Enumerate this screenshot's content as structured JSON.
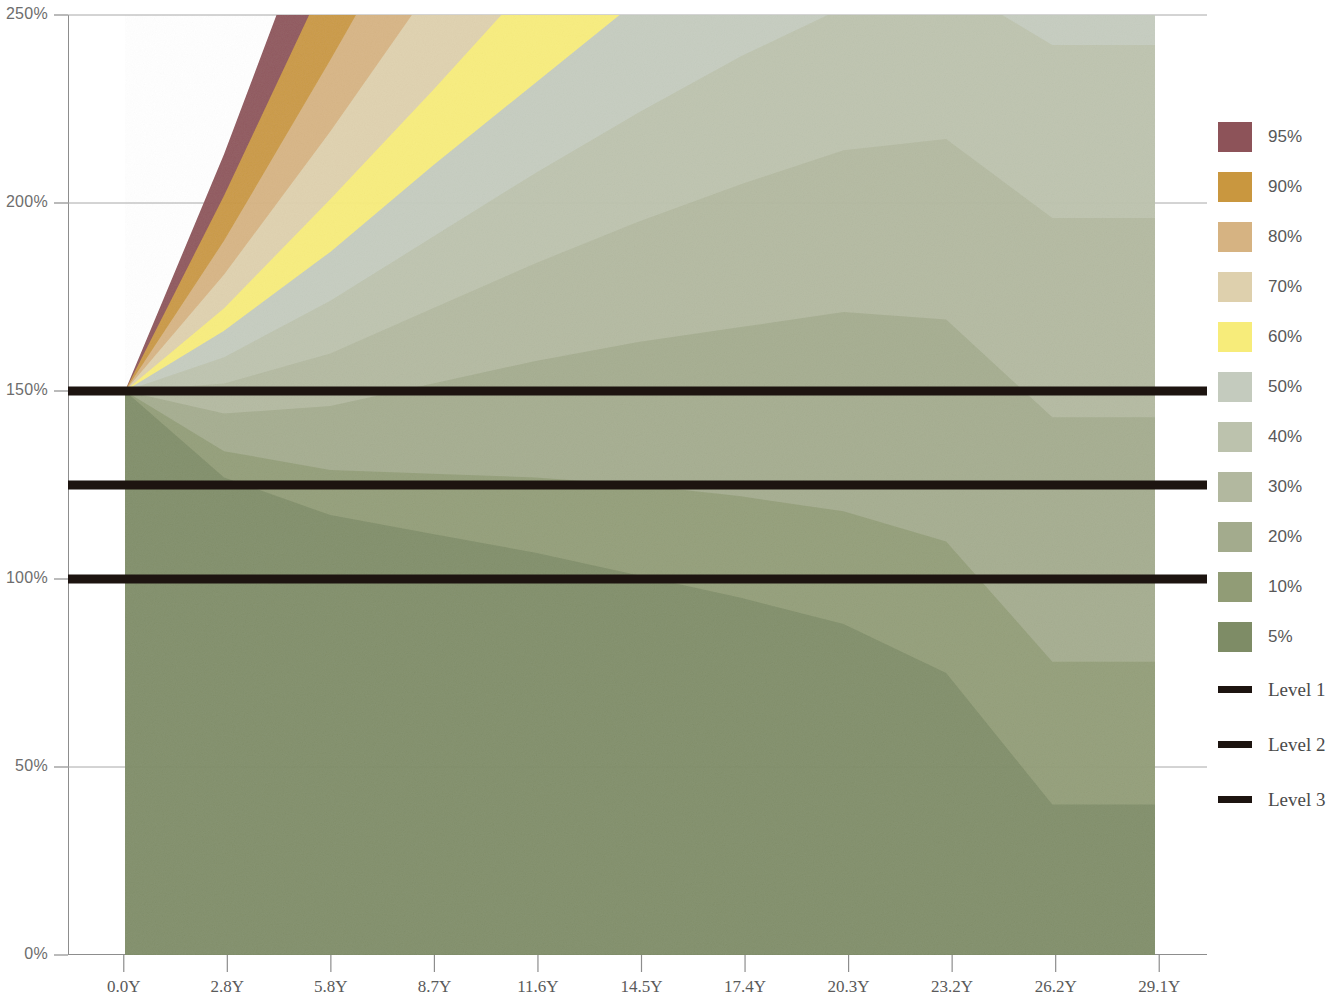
{
  "chart_data": {
    "type": "area",
    "title": "",
    "subtitle": "",
    "xlabel": "",
    "ylabel": "",
    "xlim": [
      0.0,
      29.1
    ],
    "ylim": [
      0,
      250
    ],
    "grid": true,
    "legend_position": "right",
    "y_tick_labels": [
      "250%",
      "200%",
      "150%",
      "100%",
      "50%",
      "0%"
    ],
    "y_tick_values": [
      250,
      200,
      150,
      100,
      50,
      0
    ],
    "x_tick_labels": [
      "0.0Y",
      "2.8Y",
      "5.8Y",
      "8.7Y",
      "11.6Y",
      "14.5Y",
      "17.4Y",
      "20.3Y",
      "23.2Y",
      "26.2Y",
      "29.1Y"
    ],
    "x_tick_values": [
      0.0,
      2.8,
      5.8,
      8.7,
      11.6,
      14.5,
      17.4,
      20.3,
      23.2,
      26.2,
      29.1
    ],
    "x": [
      0.0,
      2.8,
      5.8,
      8.7,
      11.6,
      14.5,
      17.4,
      20.3,
      23.2,
      26.2,
      29.1
    ],
    "series": [
      {
        "name": "95%",
        "color": "#8d5359",
        "values": [
          150,
          213,
          288,
          360,
          430,
          498,
          560,
          612,
          645,
          640,
          0
        ]
      },
      {
        "name": "90%",
        "color": "#c9973f",
        "values": [
          150,
          202,
          262,
          322,
          382,
          440,
          492,
          538,
          568,
          560,
          0
        ]
      },
      {
        "name": "80%",
        "color": "#d6b382",
        "values": [
          150,
          190,
          238,
          286,
          334,
          380,
          424,
          462,
          488,
          480,
          0
        ]
      },
      {
        "name": "70%",
        "color": "#ded0ad",
        "values": [
          150,
          181,
          219,
          258,
          297,
          334,
          370,
          400,
          422,
          412,
          0
        ]
      },
      {
        "name": "60%",
        "color": "#f7ec7a",
        "values": [
          150,
          172,
          201,
          230,
          260,
          288,
          315,
          338,
          354,
          342,
          0
        ]
      },
      {
        "name": "50%",
        "color": "#c4cbbe",
        "values": [
          150,
          166,
          187,
          210,
          232,
          254,
          274,
          292,
          303,
          288,
          0
        ]
      },
      {
        "name": "40%",
        "color": "#bcc2ad",
        "values": [
          150,
          159,
          174,
          191,
          208,
          224,
          239,
          252,
          259,
          242,
          0
        ]
      },
      {
        "name": "30%",
        "color": "#b2b89f",
        "values": [
          150,
          152,
          160,
          172,
          184,
          195,
          205,
          214,
          217,
          196,
          0
        ]
      },
      {
        "name": "20%",
        "color": "#a3ab8d",
        "values": [
          150,
          144,
          146,
          152,
          158,
          163,
          167,
          171,
          169,
          143,
          0
        ]
      },
      {
        "name": "10%",
        "color": "#919c76",
        "values": [
          150,
          134,
          129,
          128,
          127,
          125,
          122,
          118,
          110,
          78,
          0
        ]
      },
      {
        "name": "5%",
        "color": "#7e8c66",
        "values": [
          150,
          127,
          117,
          112,
          107,
          101,
          95,
          88,
          75,
          40,
          0
        ]
      }
    ],
    "reference_lines": [
      {
        "name": "Level 1",
        "value": 150,
        "color": "#1d1410"
      },
      {
        "name": "Level 2",
        "value": 125,
        "color": "#1d1410"
      },
      {
        "name": "Level 3",
        "value": 100,
        "color": "#1d1410"
      }
    ]
  },
  "axes": {
    "y_ticks": [
      {
        "label": "250%",
        "value": 250
      },
      {
        "label": "200%",
        "value": 200
      },
      {
        "label": "150%",
        "value": 150
      },
      {
        "label": "100%",
        "value": 100
      },
      {
        "label": "50%",
        "value": 50
      },
      {
        "label": "0%",
        "value": 0
      }
    ],
    "x_ticks": [
      {
        "label": "0.0Y"
      },
      {
        "label": "2.8Y"
      },
      {
        "label": "5.8Y"
      },
      {
        "label": "8.7Y"
      },
      {
        "label": "11.6Y"
      },
      {
        "label": "14.5Y"
      },
      {
        "label": "17.4Y"
      },
      {
        "label": "20.3Y"
      },
      {
        "label": "23.2Y"
      },
      {
        "label": "26.2Y"
      },
      {
        "label": "29.1Y"
      }
    ]
  },
  "legend": {
    "bands": [
      {
        "label": "95%",
        "color": "#8d5359"
      },
      {
        "label": "90%",
        "color": "#c9973f"
      },
      {
        "label": "80%",
        "color": "#d6b382"
      },
      {
        "label": "70%",
        "color": "#ded0ad"
      },
      {
        "label": "60%",
        "color": "#f7ec7a"
      },
      {
        "label": "50%",
        "color": "#c4cbbe"
      },
      {
        "label": "40%",
        "color": "#bcc2ad"
      },
      {
        "label": "30%",
        "color": "#b2b89f"
      },
      {
        "label": "20%",
        "color": "#a3ab8d"
      },
      {
        "label": "10%",
        "color": "#919c76"
      },
      {
        "label": "5%",
        "color": "#7e8c66"
      }
    ],
    "levels": [
      {
        "label": "Level 1",
        "color": "#1d1410"
      },
      {
        "label": "Level 2",
        "color": "#1d1410"
      },
      {
        "label": "Level 3",
        "color": "#1d1410"
      }
    ]
  },
  "colors": {
    "axis": "#8d8d8d",
    "grid": "#a8a8a8",
    "background": "#ffffff",
    "level_line": "#1d1410"
  }
}
